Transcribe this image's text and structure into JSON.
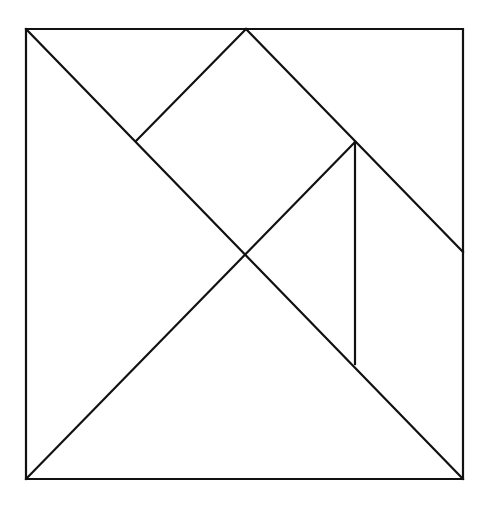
{
  "diagram": {
    "type": "tangram",
    "stroke_color": "#111111",
    "background": "#ffffff",
    "outer_square": {
      "x1": 26,
      "y1": 29,
      "x2": 463,
      "y2": 479
    },
    "pieces": [
      {
        "name": "large-triangle-left",
        "points": [
          [
            26,
            29
          ],
          [
            246,
            253
          ],
          [
            26,
            479
          ]
        ]
      },
      {
        "name": "large-triangle-bottom",
        "points": [
          [
            26,
            479
          ],
          [
            246,
            253
          ],
          [
            463,
            479
          ]
        ]
      },
      {
        "name": "small-triangle-top-left",
        "points": [
          [
            26,
            29
          ],
          [
            246,
            29
          ],
          [
            136,
            141
          ]
        ]
      },
      {
        "name": "square",
        "points": [
          [
            136,
            141
          ],
          [
            246,
            29
          ],
          [
            355,
            142
          ],
          [
            246,
            253
          ]
        ]
      },
      {
        "name": "small-triangle-center",
        "points": [
          [
            246,
            253
          ],
          [
            355,
            142
          ],
          [
            355,
            364
          ]
        ]
      },
      {
        "name": "parallelogram-right",
        "points": [
          [
            355,
            142
          ],
          [
            463,
            252
          ],
          [
            463,
            479
          ],
          [
            355,
            364
          ]
        ]
      },
      {
        "name": "medium-triangle-top-right",
        "points": [
          [
            246,
            29
          ],
          [
            463,
            29
          ],
          [
            463,
            252
          ]
        ]
      }
    ]
  }
}
